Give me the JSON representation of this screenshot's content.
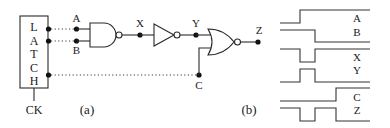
{
  "figure": {
    "part_a_label": "(a)",
    "part_b_label": "(b)"
  },
  "latch": {
    "letters": [
      "L",
      "A",
      "T",
      "C",
      "H"
    ],
    "clock_label": "CK"
  },
  "circuit": {
    "inputs": [
      "A",
      "B",
      "C"
    ],
    "nodes": [
      "X",
      "Y",
      "Z"
    ],
    "gates": [
      {
        "type": "NAND",
        "inputs": [
          "A",
          "B"
        ],
        "output": "X"
      },
      {
        "type": "NOT",
        "inputs": [
          "X"
        ],
        "output": "Y"
      },
      {
        "type": "NOR",
        "inputs": [
          "Y",
          "C"
        ],
        "output": "Z"
      }
    ],
    "labels": {
      "A": "A",
      "B": "B",
      "C": "C",
      "X": "X",
      "Y": "Y",
      "Z": "Z"
    }
  },
  "waveforms": {
    "pairs": [
      {
        "top": "A",
        "bottom": "B"
      },
      {
        "top": "X",
        "bottom": "Y"
      },
      {
        "top": "C",
        "bottom": "Z"
      }
    ],
    "signals": [
      {
        "name": "A",
        "description": "low then rises at t1, stays high"
      },
      {
        "name": "B",
        "description": "high then falls at t2, stays low"
      },
      {
        "name": "X",
        "description": "high, glitch low between t1 and t2, high"
      },
      {
        "name": "Y",
        "description": "low, glitch high between t1 and t2, low"
      },
      {
        "name": "C",
        "description": "low then rises at t3, stays high"
      },
      {
        "name": "Z",
        "description": "high, low pulse t1-t2, high t2-t3, low after t3"
      }
    ]
  }
}
